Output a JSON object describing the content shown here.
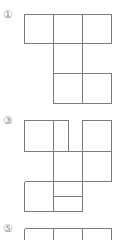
{
  "figures": [
    {
      "label": "①",
      "x": 3,
      "y": 9
    },
    {
      "label": "③",
      "x": 3,
      "y": 115
    },
    {
      "label": "⑤",
      "x": 3,
      "y": 223
    }
  ],
  "line_color": "#7a7a7a",
  "background": "#ffffff"
}
